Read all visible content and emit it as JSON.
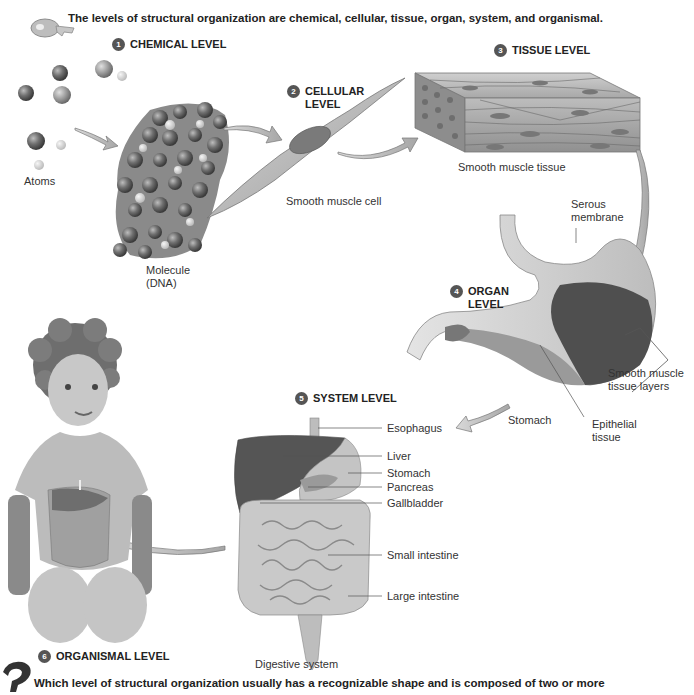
{
  "summary": "The levels of structural organization are chemical, cellular, tissue, organ, system, and organismal.",
  "levels": [
    {
      "number": "1",
      "title": "CHEMICAL LEVEL"
    },
    {
      "number": "2",
      "title_line1": "CELLULAR",
      "title_line2": "LEVEL"
    },
    {
      "number": "3",
      "title": "TISSUE LEVEL"
    },
    {
      "number": "4",
      "title_line1": "ORGAN",
      "title_line2": "LEVEL"
    },
    {
      "number": "5",
      "title": "SYSTEM LEVEL"
    },
    {
      "number": "6",
      "title": "ORGANISMAL LEVEL"
    }
  ],
  "chemical": {
    "atoms_label": "Atoms",
    "molecule_label_line1": "Molecule",
    "molecule_label_line2": "(DNA)"
  },
  "cellular": {
    "caption": "Smooth muscle cell"
  },
  "tissue": {
    "caption": "Smooth muscle tissue"
  },
  "organ": {
    "serous_line1": "Serous",
    "serous_line2": "membrane",
    "smooth_line1": "Smooth muscle",
    "smooth_line2": "tissue layers",
    "stomach": "Stomach",
    "epithelial_line1": "Epithelial",
    "epithelial_line2": "tissue"
  },
  "system": {
    "labels": [
      "Esophagus",
      "Liver",
      "Stomach",
      "Pancreas",
      "Gallbladder",
      "Small intestine",
      "Large intestine"
    ],
    "caption": "Digestive system"
  },
  "question": "Which level of structural organization usually has a recognizable shape and is composed of two or more"
}
